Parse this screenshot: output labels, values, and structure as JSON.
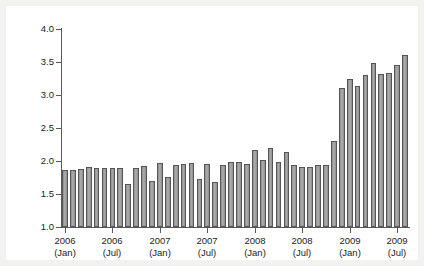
{
  "chart_data": {
    "type": "bar",
    "title": "",
    "subtitle": "",
    "xlabel": "",
    "ylabel": "Spread, percentage points",
    "ylim": [
      1.0,
      4.0
    ],
    "ytick_labels": [
      "1.0",
      "1.5",
      "2.0",
      "2.5",
      "3.0",
      "3.5",
      "4.0"
    ],
    "ytick_values": [
      1.0,
      1.5,
      2.0,
      2.5,
      3.0,
      3.5,
      4.0
    ],
    "grid": false,
    "legend": "none",
    "bar_color": "#9a9a9a",
    "bar_edge_color": "#555555",
    "axis_color": "#5a5a5a",
    "background_color": "#ffffff",
    "page_background_color": "#f2f2f0",
    "xtick_labels": [
      {
        "year": "2006",
        "month": "(Jan)",
        "index": 0
      },
      {
        "year": "2006",
        "month": "(Jul)",
        "index": 6
      },
      {
        "year": "2007",
        "month": "(Jan)",
        "index": 12
      },
      {
        "year": "2007",
        "month": "(Jul)",
        "index": 18
      },
      {
        "year": "2008",
        "month": "(Jan)",
        "index": 24
      },
      {
        "year": "2008",
        "month": "(Jul)",
        "index": 30
      },
      {
        "year": "2009",
        "month": "(Jan)",
        "index": 36
      },
      {
        "year": "2009",
        "month": "(Jul)",
        "index": 42
      }
    ],
    "categories": [
      "2006-Jan",
      "2006-Feb",
      "2006-Mar",
      "2006-Apr",
      "2006-May",
      "2006-Jun",
      "2006-Jul",
      "2006-Aug",
      "2006-Sep",
      "2006-Oct",
      "2006-Nov",
      "2006-Dec",
      "2007-Jan",
      "2007-Feb",
      "2007-Mar",
      "2007-Apr",
      "2007-May",
      "2007-Jun",
      "2007-Jul",
      "2007-Aug",
      "2007-Sep",
      "2007-Oct",
      "2007-Nov",
      "2007-Dec",
      "2008-Jan",
      "2008-Feb",
      "2008-Mar",
      "2008-Apr",
      "2008-May",
      "2008-Jun",
      "2008-Jul",
      "2008-Aug",
      "2008-Sep",
      "2008-Oct",
      "2008-Nov",
      "2008-Dec",
      "2009-Jan",
      "2009-Feb",
      "2009-Mar",
      "2009-Apr",
      "2009-May",
      "2009-Jun",
      "2009-Jul",
      "2009-Aug"
    ],
    "values": [
      1.86,
      1.86,
      1.88,
      1.91,
      1.9,
      1.9,
      1.9,
      1.9,
      1.65,
      1.9,
      1.93,
      1.7,
      1.97,
      1.76,
      1.94,
      1.95,
      1.97,
      1.72,
      1.96,
      1.68,
      1.94,
      1.99,
      1.98,
      1.96,
      2.17,
      2.01,
      2.19,
      1.99,
      2.14,
      1.94,
      1.91,
      1.91,
      1.94,
      1.94,
      2.3,
      3.11,
      3.24,
      3.13,
      3.31,
      3.49,
      3.32,
      3.34,
      3.45,
      3.61
    ]
  }
}
